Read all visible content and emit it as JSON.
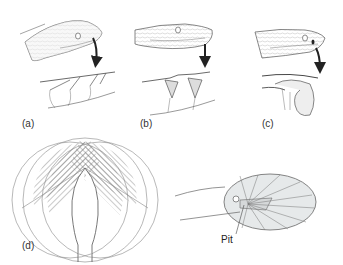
{
  "figure": {
    "panels": [
      {
        "id": "a",
        "label": "(a)",
        "description": "snake head with labial pits, arrow to pit cross-section with nerves"
      },
      {
        "id": "b",
        "label": "(b)",
        "description": "snake head with labial scale pits, arrow to cross-section of deeper pits"
      },
      {
        "id": "c",
        "label": "(c)",
        "description": "pit viper head with loreal pit, arrow to cross-section of pit organ with membrane"
      },
      {
        "id": "d",
        "label": "(d)",
        "description": "top view of head with overlapping hatched receptive fields, and side view of pit receptive field ellipse"
      }
    ],
    "callouts": {
      "pit": "Pit"
    },
    "colors": {
      "line": "#555555",
      "hatch": "#777777",
      "ellipse_fill": "#e6e9ea",
      "background": "#ffffff"
    }
  }
}
